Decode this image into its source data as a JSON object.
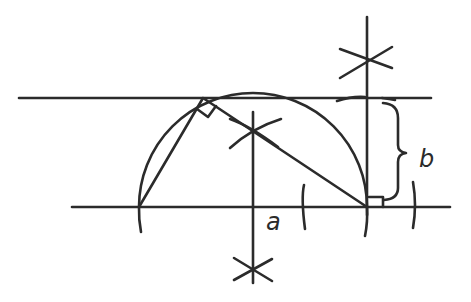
{
  "diagram": {
    "stroke_color": "#2b2b2b",
    "background": "#ffffff",
    "labels": {
      "a": "a",
      "b": "b"
    },
    "lines": {
      "top_horizontal": {
        "x1": 19,
        "y1": 98,
        "x2": 431,
        "y2": 98
      },
      "base_horizontal": {
        "x1": 72,
        "y1": 207,
        "x2": 450,
        "y2": 207
      },
      "right_vertical": {
        "x1": 367,
        "y1": 17,
        "x2": 367,
        "y2": 215
      },
      "center_vertical": {
        "x1": 253,
        "y1": 112,
        "x2": 253,
        "y2": 283
      },
      "chord_left": {
        "x1": 139,
        "y1": 207,
        "x2": 203,
        "y2": 98
      },
      "chord_right": {
        "x1": 203,
        "y1": 98,
        "x2": 367,
        "y2": 207
      }
    },
    "semicircle": {
      "cx": 253,
      "cy": 207,
      "r": 114
    },
    "right_angle_marks": [
      {
        "name": "apex",
        "x": 203,
        "y": 98
      },
      {
        "name": "base-right",
        "x": 367,
        "y": 207
      }
    ],
    "construction_crosses": [
      {
        "name": "top-right",
        "x": 367,
        "y": 58
      },
      {
        "name": "bottom-center",
        "x": 253,
        "y": 272
      },
      {
        "name": "mid-center",
        "x": 253,
        "y": 130
      }
    ],
    "brace": {
      "x": 390,
      "y_top": 103,
      "y_bottom": 200
    }
  }
}
